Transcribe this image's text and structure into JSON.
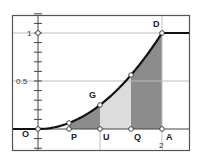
{
  "chart_data": {
    "type": "line",
    "title": "",
    "xlabel": "",
    "ylabel": "",
    "function": "F(x) = 0 for x<0; x^2/4 for 0<=x<=2; 1 for x>2",
    "xlim": [
      -0.42,
      2.45
    ],
    "ylim": [
      -0.23,
      1.23
    ],
    "grid": true,
    "y_ticks": [
      {
        "value": 0.5,
        "label": "0.5"
      },
      {
        "value": 1,
        "label": "1"
      }
    ],
    "y_minor_tick_step": 0.1,
    "x_ticks": [
      {
        "value": 2,
        "label": "2"
      }
    ],
    "points": [
      {
        "name": "O",
        "x": 0,
        "y": 0
      },
      {
        "name": "P",
        "x": 0.5,
        "y": 0
      },
      {
        "name": "U",
        "x": 1,
        "y": 0
      },
      {
        "name": "Q",
        "x": 1.5,
        "y": 0
      },
      {
        "name": "A",
        "x": 2,
        "y": 0
      },
      {
        "name": "G",
        "x": 1,
        "y": 0.25
      },
      {
        "name": "D",
        "x": 2,
        "y": 1
      }
    ],
    "curve_markers": [
      {
        "x": 0.5,
        "y": 0.0625
      },
      {
        "x": 1,
        "y": 0.25
      },
      {
        "x": 1.5,
        "y": 0.5625
      },
      {
        "x": 2,
        "y": 1
      }
    ],
    "shaded_regions": [
      {
        "from": 0.5,
        "to": 1,
        "shade": "dark"
      },
      {
        "from": 1,
        "to": 1.5,
        "shade": "light"
      },
      {
        "from": 1.5,
        "to": 2,
        "shade": "dark"
      }
    ],
    "colors": {
      "dark": "#8c8c8c",
      "light": "#dcdcdc",
      "curve": "#111111",
      "grid": "#bdbdbd",
      "frame": "#555555"
    }
  },
  "labels": {
    "O": "O",
    "P": "P",
    "U": "U",
    "Q": "Q",
    "A": "A",
    "G": "G",
    "D": "D",
    "y1": "1",
    "y05": "0.5",
    "x2": "2"
  }
}
